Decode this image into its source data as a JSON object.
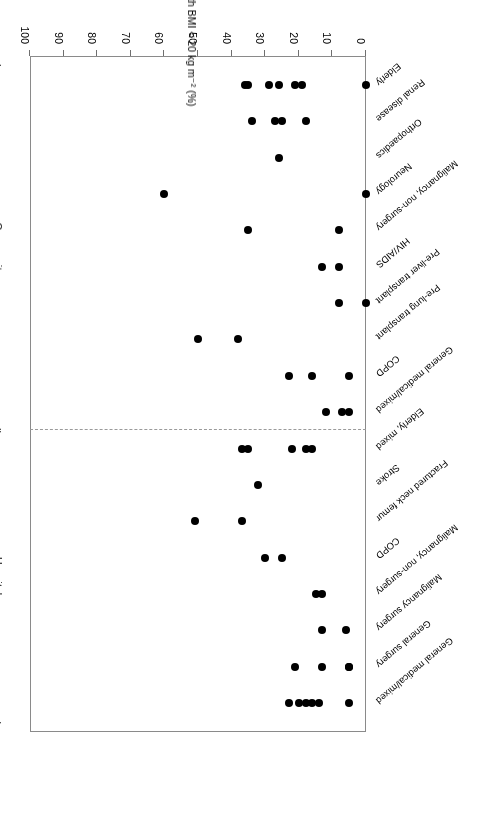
{
  "figure": {
    "orientation_note": "rotated-180",
    "dot_color": "#000000",
    "frame_color": "#8a8a8a"
  },
  "axis": {
    "title": "Proportion of patients with BMI < 20 kg m⁻² (%)",
    "ticks": [
      "0",
      "10",
      "20",
      "30",
      "40",
      "50",
      "60",
      "70",
      "80",
      "90",
      "100"
    ],
    "min": 0,
    "max": 100
  },
  "groups": [
    {
      "label": "Hospital"
    },
    {
      "label": "Community"
    }
  ],
  "chart_data": {
    "type": "scatter",
    "title": "",
    "xlabel": "Proportion of patients with BMI < 20 kg m⁻² (%)",
    "ylabel": "",
    "xlim": [
      0,
      100
    ],
    "grid": false,
    "legend": "none",
    "orientation": "horizontal-strip-plot",
    "groups": [
      "Hospital",
      "Community"
    ],
    "categories": [
      {
        "group": "Hospital",
        "label": "General medical/mixed",
        "values": [
          5,
          14,
          16,
          18,
          20,
          23
        ]
      },
      {
        "group": "Hospital",
        "label": "General surgery",
        "values": [
          5,
          5,
          13,
          21
        ]
      },
      {
        "group": "Hospital",
        "label": "Malignancy surgery",
        "values": [
          6,
          13
        ]
      },
      {
        "group": "Hospital",
        "label": "Malignancy, non-surgery",
        "values": [
          13,
          15
        ]
      },
      {
        "group": "Hospital",
        "label": "COPD",
        "values": [
          25,
          30
        ]
      },
      {
        "group": "Hospital",
        "label": "Fractured neck femur",
        "values": [
          37,
          51
        ]
      },
      {
        "group": "Hospital",
        "label": "Stroke",
        "values": [
          32
        ]
      },
      {
        "group": "Hospital",
        "label": "Elderly, mixed",
        "values": [
          16,
          18,
          22,
          35,
          37
        ]
      },
      {
        "group": "Community",
        "label": "General medical/mixed",
        "values": [
          5,
          7,
          12
        ]
      },
      {
        "group": "Community",
        "label": "COPD",
        "values": [
          5,
          16,
          23
        ]
      },
      {
        "group": "Community",
        "label": "Pre-lung transplant",
        "values": [
          38,
          50
        ]
      },
      {
        "group": "Community",
        "label": "Pre-liver transplant",
        "values": [
          0,
          8
        ]
      },
      {
        "group": "Community",
        "label": "HIV/AIDS",
        "values": [
          8,
          13
        ]
      },
      {
        "group": "Community",
        "label": "Malignancy, non-surgery",
        "values": [
          8,
          35
        ]
      },
      {
        "group": "Community",
        "label": "Neurology",
        "values": [
          0,
          60
        ]
      },
      {
        "group": "Community",
        "label": "Orthopaedics",
        "values": [
          26
        ]
      },
      {
        "group": "Community",
        "label": "Renal disease",
        "values": [
          18,
          25,
          27,
          34
        ]
      },
      {
        "group": "Community",
        "label": "Elderly",
        "values": [
          0,
          19,
          21,
          26,
          29,
          35,
          36
        ]
      }
    ]
  }
}
